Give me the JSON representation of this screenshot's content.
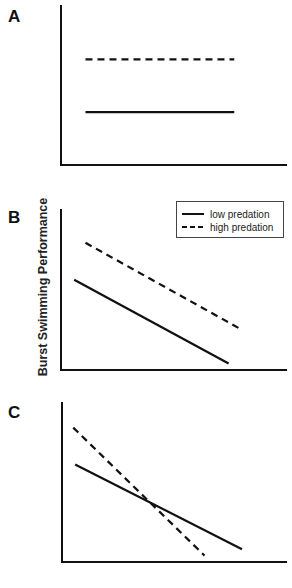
{
  "chart_data": [
    {
      "type": "line",
      "panel": "A",
      "title": "",
      "xlabel": "",
      "ylabel": "",
      "x": [
        0,
        1
      ],
      "xlim": [
        0,
        1.2
      ],
      "ylim": [
        0,
        1
      ],
      "series": [
        {
          "name": "low predation",
          "style": "solid",
          "values": [
            0.33,
            0.33
          ]
        },
        {
          "name": "high predation",
          "style": "dashed",
          "values": [
            0.66,
            0.66
          ]
        }
      ]
    },
    {
      "type": "line",
      "panel": "B",
      "title": "",
      "xlabel": "",
      "ylabel": "Burst Swimming Performance",
      "x": [
        0,
        1
      ],
      "xlim": [
        0,
        1.2
      ],
      "ylim": [
        0,
        1
      ],
      "legend": {
        "position": "top-right",
        "entries": [
          "low predation",
          "high predation"
        ]
      },
      "series": [
        {
          "name": "low predation",
          "style": "solid",
          "x": [
            0.07,
            0.89
          ],
          "values": [
            0.56,
            0.04
          ]
        },
        {
          "name": "high predation",
          "style": "dashed",
          "x": [
            0.13,
            0.96
          ],
          "values": [
            0.79,
            0.25
          ]
        }
      ]
    },
    {
      "type": "line",
      "panel": "C",
      "title": "",
      "xlabel": "",
      "ylabel": "",
      "x": [
        0,
        1
      ],
      "xlim": [
        0,
        1.2
      ],
      "ylim": [
        0,
        1
      ],
      "series": [
        {
          "name": "low predation",
          "style": "solid",
          "x": [
            0.07,
            0.96
          ],
          "values": [
            0.61,
            0.08
          ]
        },
        {
          "name": "high predation",
          "style": "dashed",
          "x": [
            0.06,
            0.76
          ],
          "values": [
            0.84,
            0.04
          ]
        }
      ]
    }
  ],
  "legend": {
    "low_label": "low predation",
    "high_label": "high predation"
  }
}
